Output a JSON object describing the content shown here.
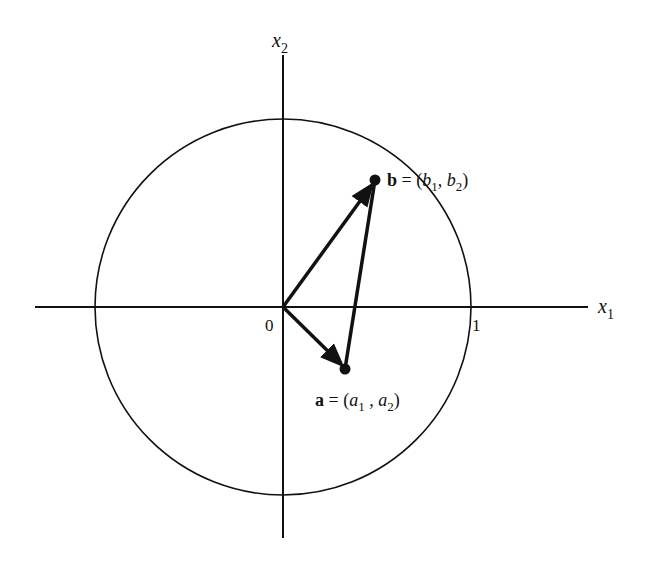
{
  "figure": {
    "axes": {
      "x_label": "x",
      "x_sub": "1",
      "y_label": "x",
      "y_sub": "2",
      "origin_label": "0",
      "unit_tick_label": "1"
    },
    "points": {
      "b": {
        "name": "b",
        "equals": " = (",
        "c1": "b",
        "c1_sub": "1",
        "sep": ", ",
        "c2": "b",
        "c2_sub": "2",
        "close": ")"
      },
      "a": {
        "name": "a",
        "equals": " = (",
        "c1": "a",
        "c1_sub": "1",
        "sep": " , ",
        "c2": "a",
        "c2_sub": "2",
        "close": ")"
      }
    },
    "colors": {
      "stroke": "#111111",
      "background": "#ffffff"
    }
  }
}
